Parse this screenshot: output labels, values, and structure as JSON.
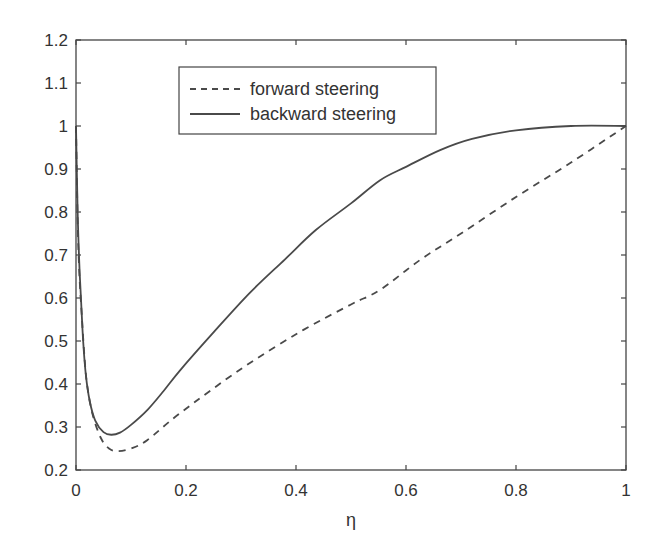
{
  "chart_data": {
    "type": "line",
    "title": "",
    "xlabel": "η",
    "ylabel": "",
    "xlim": [
      0,
      1
    ],
    "ylim": [
      0.2,
      1.2
    ],
    "grid": false,
    "legend_position": "upper-left-inside",
    "x_ticks": [
      "0",
      "0.2",
      "0.4",
      "0.6",
      "0.8",
      "1"
    ],
    "y_ticks": [
      "0.2",
      "0.3",
      "0.4",
      "0.5",
      "0.6",
      "0.7",
      "0.8",
      "0.9",
      "1",
      "1.1",
      "1.2"
    ],
    "series": [
      {
        "name": "forward steering",
        "style": "dashed",
        "color": "#4a4a4a",
        "x": [
          0,
          0.003,
          0.006,
          0.01,
          0.015,
          0.02,
          0.03,
          0.045,
          0.06,
          0.076,
          0.1,
          0.13,
          0.19,
          0.3,
          0.407,
          0.5,
          0.553,
          0.625,
          0.7,
          0.8,
          0.9,
          1.0
        ],
        "y": [
          1.0,
          0.78,
          0.66,
          0.57,
          0.47,
          0.4,
          0.33,
          0.275,
          0.25,
          0.244,
          0.25,
          0.27,
          0.333,
          0.435,
          0.521,
          0.585,
          0.619,
          0.688,
          0.75,
          0.835,
          0.915,
          1.0
        ]
      },
      {
        "name": "backward steering",
        "style": "solid",
        "color": "#4a4a4a",
        "x": [
          0,
          0.003,
          0.006,
          0.009,
          0.013,
          0.018,
          0.025,
          0.035,
          0.05,
          0.064,
          0.08,
          0.1,
          0.13,
          0.16,
          0.19,
          0.25,
          0.316,
          0.38,
          0.436,
          0.5,
          0.553,
          0.6,
          0.662,
          0.72,
          0.8,
          0.9,
          1.0
        ],
        "y": [
          1.0,
          0.8,
          0.68,
          0.6,
          0.5,
          0.42,
          0.36,
          0.315,
          0.288,
          0.282,
          0.287,
          0.305,
          0.34,
          0.385,
          0.433,
          0.52,
          0.612,
          0.69,
          0.758,
          0.82,
          0.874,
          0.905,
          0.944,
          0.97,
          0.99,
          1.0,
          1.0
        ]
      }
    ]
  },
  "legend": {
    "items": [
      {
        "label": "forward steering",
        "style": "dashed"
      },
      {
        "label": "backward steering",
        "style": "solid"
      }
    ]
  }
}
